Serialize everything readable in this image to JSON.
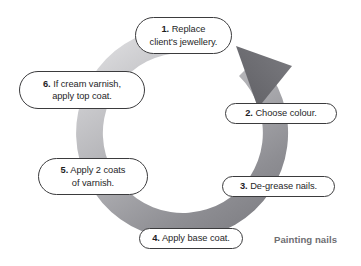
{
  "diagram": {
    "title": "Painting nails",
    "type": "circular-cycle-flowchart",
    "direction": "clockwise-steps-with-counterclockwise-arrowhead",
    "caption": "Painting nails",
    "accent_colors": {
      "box_border": "#3b3b3d",
      "box_fill": "#ffffff",
      "text": "#262628",
      "caption": "#6e6e72",
      "ring_light": "#ececed",
      "ring_mid": "#a8a8ab",
      "ring_dark": "#77777b",
      "arrow_head": "#6f6f73",
      "background": "#ffffff"
    },
    "steps": [
      {
        "number": "1.",
        "text": "Replace client's jewellery.",
        "line1": "1. Replace",
        "line2": "client's jewellery.",
        "position": "top"
      },
      {
        "number": "2.",
        "text": "Choose colour.",
        "line1": "2. Choose colour.",
        "line2": "",
        "position": "upper-right"
      },
      {
        "number": "3.",
        "text": "De-grease nails.",
        "line1": "3. De-grease nails.",
        "line2": "",
        "position": "lower-right"
      },
      {
        "number": "4.",
        "text": "Apply base coat.",
        "line1": "4. Apply base coat.",
        "line2": "",
        "position": "bottom"
      },
      {
        "number": "5.",
        "text": "Apply 2 coats of varnish.",
        "line1": "5. Apply 2 coats",
        "line2": "of varnish.",
        "position": "lower-left"
      },
      {
        "number": "6.",
        "text": "If cream varnish, apply top coat.",
        "line1": "6. If cream varnish,",
        "line2": "apply top coat.",
        "position": "upper-left"
      }
    ],
    "ring": {
      "name": "cycle-arrow-ring",
      "center_x": 182,
      "center_y": 133,
      "outer_radius": 106,
      "inner_radius": 80,
      "arrowhead_label": "cycle-direction-arrowhead"
    }
  }
}
